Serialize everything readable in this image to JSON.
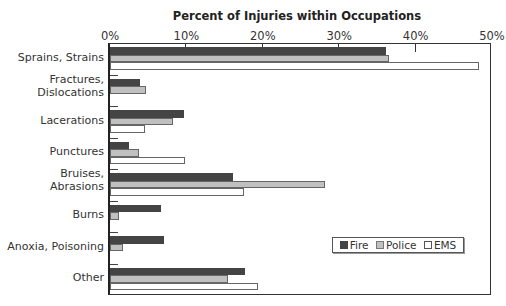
{
  "chart_data": {
    "type": "bar",
    "orientation": "horizontal",
    "title": "Percent of Injuries within Occupations",
    "xlabel": "",
    "ylabel": "",
    "xlim": [
      0,
      50
    ],
    "x_ticks": [
      "0%",
      "10%",
      "20%",
      "30%",
      "40%",
      "50%"
    ],
    "x_axis_position": "top",
    "grid": false,
    "legend_position": "lower right inside",
    "categories": [
      "Sprains, Strains",
      "Fractures, Dislocations",
      "Lacerations",
      "Punctures",
      "Bruises, Abrasions",
      "Burns",
      "Anoxia, Poisoning",
      "Other"
    ],
    "category_display_lines": [
      [
        "Sprains, Strains"
      ],
      [
        "Fractures,",
        "Dislocations"
      ],
      [
        "Lacerations"
      ],
      [
        "Punctures"
      ],
      [
        "Bruises,",
        "Abrasions"
      ],
      [
        "Burns"
      ],
      [
        "Anoxia, Poisoning"
      ],
      [
        "Other"
      ]
    ],
    "series": [
      {
        "name": "Fire",
        "color": "#444444",
        "values": [
          36.1,
          3.9,
          9.7,
          2.5,
          16.1,
          6.7,
          7.1,
          17.7
        ]
      },
      {
        "name": "Police",
        "color": "#c0c0c0",
        "values": [
          36.5,
          4.7,
          8.2,
          3.8,
          28.1,
          1.2,
          1.7,
          15.5
        ]
      },
      {
        "name": "EMS",
        "color": "#ffffff",
        "values": [
          48.3,
          0,
          4.6,
          9.8,
          17.5,
          0,
          0,
          19.4
        ]
      }
    ]
  }
}
